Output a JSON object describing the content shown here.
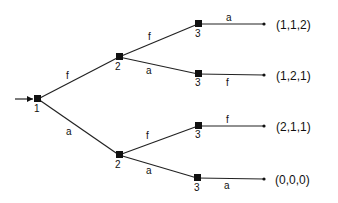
{
  "diagram": {
    "type": "game-tree",
    "nodes": [
      {
        "id": "n1",
        "player": "1",
        "x": 38,
        "y": 99
      },
      {
        "id": "n2a",
        "player": "2",
        "x": 119,
        "y": 57
      },
      {
        "id": "n2b",
        "player": "2",
        "x": 119,
        "y": 155
      },
      {
        "id": "n3a",
        "player": "3",
        "x": 198,
        "y": 24
      },
      {
        "id": "n3b",
        "player": "3",
        "x": 198,
        "y": 74
      },
      {
        "id": "n3c",
        "player": "3",
        "x": 198,
        "y": 126
      },
      {
        "id": "n3d",
        "player": "3",
        "x": 197,
        "y": 178
      }
    ],
    "edges": [
      {
        "from": "n1",
        "to": "n2a",
        "label": "f"
      },
      {
        "from": "n1",
        "to": "n2b",
        "label": "a"
      },
      {
        "from": "n2a",
        "to": "n3a",
        "label": "f"
      },
      {
        "from": "n2a",
        "to": "n3b",
        "label": "a"
      },
      {
        "from": "n2b",
        "to": "n3c",
        "label": "f"
      },
      {
        "from": "n2b",
        "to": "n3d",
        "label": "a"
      },
      {
        "from": "n3a",
        "to": "t1",
        "label": "a"
      },
      {
        "from": "n3b",
        "to": "t2",
        "label": "f"
      },
      {
        "from": "n3c",
        "to": "t3",
        "label": "f"
      },
      {
        "from": "n3d",
        "to": "t4",
        "label": "a"
      }
    ],
    "payoffs": [
      "(1,1,2)",
      "(1,2,1)",
      "(2,1,1)",
      "(0,0,0)"
    ],
    "player_labels": [
      "1",
      "2",
      "2",
      "3",
      "3",
      "3",
      "3"
    ],
    "edge_labels": {
      "n1_upper": "f",
      "n1_lower": "a",
      "n2a_upper": "f",
      "n2a_lower": "a",
      "n2b_upper": "f",
      "n2b_lower": "a",
      "n3a_terminal": "a",
      "n3b_terminal": "f",
      "n3c_terminal": "f",
      "n3d_terminal": "a"
    }
  }
}
